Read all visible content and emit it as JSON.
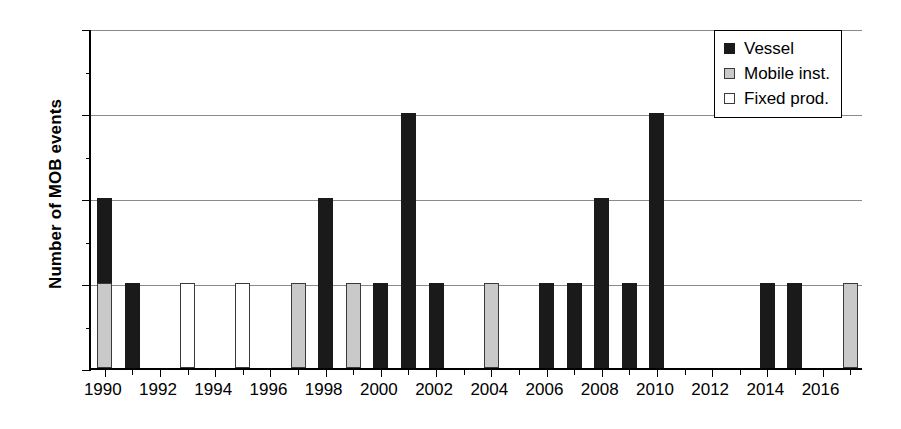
{
  "chart_data": {
    "type": "bar",
    "stacked": true,
    "title": "",
    "xlabel": "",
    "ylabel": "Number of MOB events",
    "ylim": [
      0,
      4
    ],
    "yticks": [
      0,
      1,
      2,
      3,
      4
    ],
    "ytick_labels": [
      "0",
      "1",
      "2",
      "3",
      "4"
    ],
    "grid": true,
    "grid_axis": "y",
    "legend_position": "top-right",
    "categories": [
      1990,
      1991,
      1992,
      1993,
      1994,
      1995,
      1996,
      1997,
      1998,
      1999,
      2000,
      2001,
      2002,
      2003,
      2004,
      2005,
      2006,
      2007,
      2008,
      2009,
      2010,
      2011,
      2012,
      2013,
      2014,
      2015,
      2016,
      2017
    ],
    "xtick_labels": [
      "1990",
      "1992",
      "1994",
      "1996",
      "1998",
      "2000",
      "2002",
      "2004",
      "2006",
      "2008",
      "2010",
      "2012",
      "2014",
      "2016"
    ],
    "series": [
      {
        "name": "Vessel",
        "color": "#1a1a1a",
        "values": [
          1,
          1,
          0,
          0,
          0,
          0,
          0,
          0,
          2,
          0,
          1,
          3,
          1,
          0,
          0,
          0,
          1,
          1,
          2,
          1,
          3,
          0,
          0,
          0,
          1,
          1,
          0,
          0
        ]
      },
      {
        "name": "Mobile inst.",
        "color": "#c9c9c9",
        "values": [
          1,
          0,
          0,
          0,
          0,
          0,
          0,
          1,
          0,
          1,
          0,
          0,
          0,
          0,
          1,
          0,
          0,
          0,
          0,
          0,
          0,
          0,
          0,
          0,
          0,
          0,
          0,
          1
        ]
      },
      {
        "name": "Fixed prod.",
        "color": "#ffffff",
        "values": [
          0,
          0,
          0,
          1,
          0,
          1,
          0,
          0,
          0,
          0,
          0,
          0,
          0,
          0,
          0,
          0,
          0,
          0,
          0,
          0,
          0,
          0,
          0,
          0,
          0,
          0,
          0,
          0
        ]
      }
    ],
    "totals": [
      2,
      1,
      0,
      1,
      0,
      1,
      0,
      1,
      2,
      1,
      1,
      3,
      1,
      0,
      1,
      0,
      1,
      1,
      2,
      1,
      3,
      0,
      0,
      0,
      1,
      1,
      0,
      1
    ]
  },
  "legend": {
    "items": [
      {
        "label": "Vessel",
        "swatch": "vessel"
      },
      {
        "label": "Mobile inst.",
        "swatch": "mobile"
      },
      {
        "label": "Fixed prod.",
        "swatch": "fixed"
      }
    ]
  }
}
